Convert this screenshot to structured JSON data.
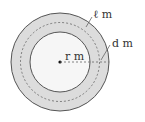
{
  "diagram": {
    "labels": {
      "length": "ℓ m",
      "width": "d m",
      "radius": "r m"
    },
    "colors": {
      "ring_fill": "#d9d9d9",
      "inner_fill": "#f5f5f5",
      "stroke": "#555555"
    }
  }
}
